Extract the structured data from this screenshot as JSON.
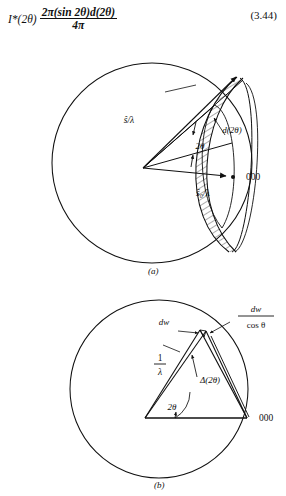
{
  "equation": {
    "lead": "I*(2θ)",
    "numerator": "2π(sin 2θ)d(2θ)",
    "denominator": "4π",
    "number": "(3.44)"
  },
  "figure": {
    "panel_a": {
      "label": "(a)",
      "labels": {
        "s_over_lambda": "ŝ/λ",
        "d_two_theta": "d(2θ)",
        "two_theta": "2θ",
        "s0_over_lambda": "ŝ₀/λ",
        "origin": "000"
      }
    },
    "panel_b": {
      "label": "(b)",
      "labels": {
        "dw": "dw",
        "dw_over_cos_num": "dw",
        "dw_over_cos_den": "cos θ",
        "one_over_lambda_num": "1",
        "one_over_lambda_den": "λ",
        "delta_two_theta": "Δ(2θ)",
        "two_theta": "2θ",
        "origin": "000"
      }
    }
  },
  "caption": {
    "lines": [
      "ed  with",
      "l sphere.",
      "a  ring of",
      "the rela-"
    ]
  },
  "colors": {
    "ink": "#101010",
    "page": "#ffffff"
  }
}
